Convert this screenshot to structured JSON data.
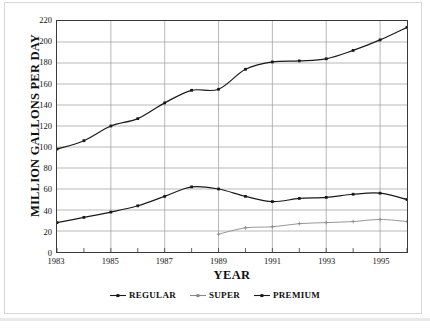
{
  "chart_data": {
    "type": "line",
    "title": "",
    "xlabel": "YEAR",
    "ylabel": "MILLION GALLONS PER DAY",
    "x": [
      1983,
      1984,
      1985,
      1986,
      1987,
      1988,
      1989,
      1990,
      1991,
      1992,
      1993,
      1994,
      1995,
      1996
    ],
    "xlim": [
      1983,
      1996
    ],
    "ylim": [
      0,
      220
    ],
    "xticks_labeled": [
      "1983",
      "1985",
      "1987",
      "1989",
      "1991",
      "1993",
      "1995"
    ],
    "xticks_labeled_values": [
      1983,
      1985,
      1987,
      1989,
      1991,
      1993,
      1995
    ],
    "yticks": [
      0,
      20,
      40,
      60,
      80,
      100,
      120,
      140,
      160,
      180,
      200,
      220
    ],
    "grid": "both",
    "legend_position": "bottom",
    "series": [
      {
        "name": "REGULAR",
        "color": "#1a1a1a",
        "marker": "square",
        "x": [
          1983,
          1984,
          1985,
          1986,
          1987,
          1988,
          1989,
          1990,
          1991,
          1992,
          1993,
          1994,
          1995,
          1996
        ],
        "values": [
          98,
          106,
          120,
          127,
          142,
          154,
          155,
          174,
          181,
          182,
          184,
          192,
          202,
          214
        ]
      },
      {
        "name": "SUPER",
        "color": "#8a8a8a",
        "marker": "plus",
        "x": [
          1989,
          1990,
          1991,
          1992,
          1993,
          1994,
          1995,
          1996
        ],
        "values": [
          17,
          23,
          24,
          27,
          28,
          29,
          31,
          29
        ]
      },
      {
        "name": "PREMIUM",
        "color": "#1a1a1a",
        "marker": "square",
        "x": [
          1983,
          1984,
          1985,
          1986,
          1987,
          1988,
          1989,
          1990,
          1991,
          1992,
          1993,
          1994,
          1995,
          1996
        ],
        "values": [
          28,
          33,
          38,
          44,
          53,
          62,
          60,
          53,
          48,
          51,
          52,
          55,
          56,
          50
        ]
      }
    ]
  },
  "legend": {
    "items": [
      {
        "label": "REGULAR",
        "color": "#1a1a1a"
      },
      {
        "label": "SUPER",
        "color": "#8a8a8a"
      },
      {
        "label": "PREMIUM",
        "color": "#1a1a1a"
      }
    ]
  },
  "axes": {
    "y_title": "MILLION GALLONS PER DAY",
    "x_title": "YEAR"
  },
  "colors": {
    "axis": "#3a3a3a",
    "grid": "#9a9a9a",
    "dark_series": "#1a1a1a",
    "gray_series": "#8a8a8a",
    "background": "#ffffff"
  }
}
